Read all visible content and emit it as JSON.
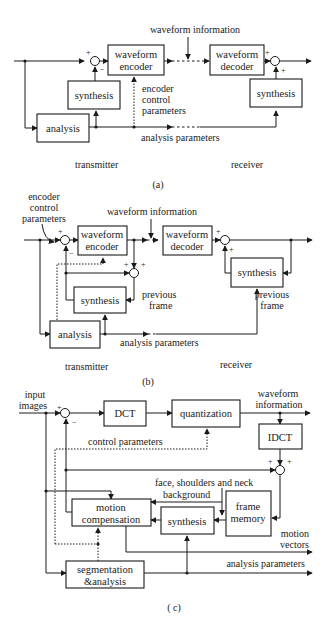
{
  "diagram_a": {
    "caption": "(a)",
    "blocks": {
      "waveform_encoder": [
        "waveform",
        "encoder"
      ],
      "waveform_decoder": [
        "waveform",
        "decoder"
      ],
      "synthesis_tx": "synthesis",
      "synthesis_rx": "synthesis",
      "analysis": "analysis"
    },
    "labels": {
      "waveform_information": "waveform information",
      "encoder_control_parameters": [
        "encoder",
        "control",
        "parameters"
      ],
      "analysis_parameters": "analysis parameters",
      "transmitter": "transmitter",
      "receiver": "receiver"
    },
    "signs": {
      "plus": "+",
      "minus": "−"
    }
  },
  "diagram_b": {
    "caption": "(b)",
    "blocks": {
      "waveform_encoder": [
        "waveform",
        "encoder"
      ],
      "waveform_decoder": [
        "waveform",
        "decoder"
      ],
      "synthesis_tx": "synthesis",
      "synthesis_rx": "synthesis",
      "analysis": "analysis"
    },
    "labels": {
      "encoder_control_parameters": [
        "encoder",
        "control",
        "parameters"
      ],
      "waveform_information": "waveform information",
      "previous_frame_tx": [
        "previous",
        "frame"
      ],
      "previous_frame_rx": [
        "previous",
        "frame"
      ],
      "analysis_parameters": "analysis parameters",
      "transmitter": "transmitter",
      "receiver": "receiver"
    },
    "signs": {
      "plus": "+",
      "minus": "−"
    }
  },
  "diagram_c": {
    "caption": "( c)",
    "blocks": {
      "dct": "DCT",
      "quantization": "quantization",
      "idct": "IDCT",
      "frame_memory": [
        "frame",
        "memory"
      ],
      "motion_compensation": [
        "motion",
        "compensation"
      ],
      "synthesis": "synthesis",
      "segmentation_analysis": [
        "segmentation",
        "&analysis"
      ]
    },
    "labels": {
      "input_images": [
        "input",
        "images"
      ],
      "waveform_information": [
        "waveform",
        "information"
      ],
      "control_parameters": "control parameters",
      "face_shoulders_neck": "face, shoulders and neck",
      "background": "background",
      "motion_vectors": [
        "motion",
        "vectors"
      ],
      "analysis_parameters": "analysis parameters"
    },
    "signs": {
      "plus": "+",
      "minus": "−"
    }
  }
}
